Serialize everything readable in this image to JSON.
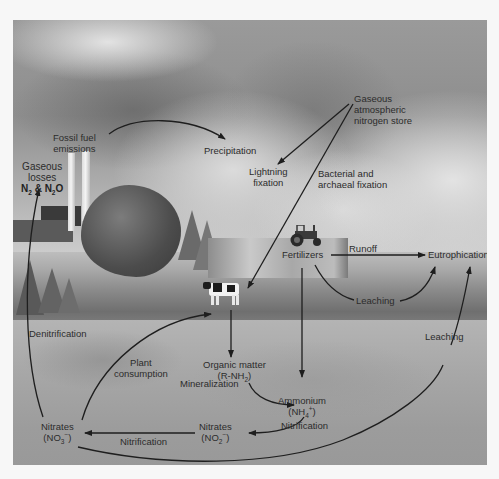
{
  "diagram": {
    "colors": {
      "page_background": "#f7f7f7",
      "text": "#2c2c2c",
      "arrow": "#1e1e1e",
      "sky": "#9a9a9a",
      "ground": "#a6a6a6"
    },
    "nodes": {
      "fossil_fuel": {
        "line1": "Fossil fuel",
        "line2": "emissions"
      },
      "precipitation": {
        "text": "Precipitation"
      },
      "gaseous_store": {
        "line1": "Gaseous",
        "line2": "atmospheric",
        "line3": "nitrogen store"
      },
      "lightning": {
        "line1": "Lightning",
        "line2": "fixation"
      },
      "bacterial": {
        "line1": "Bacterial and",
        "line2": "archaeal fixation"
      },
      "gaseous_losses": {
        "line1": "Gaseous",
        "line2": "losses",
        "formula_n": "N",
        "sub1": "2",
        "amp": " & N",
        "sub2": "2",
        "o": "O"
      },
      "fertilizers": {
        "text": "Fertilizers"
      },
      "runoff": {
        "text": "Runoff"
      },
      "eutrophication": {
        "text": "Eutrophication"
      },
      "leaching_upper": {
        "text": "Leaching"
      },
      "leaching_right": {
        "text": "Leaching"
      },
      "denitrification": {
        "text": "Denitrification"
      },
      "plant_consumption": {
        "line1": "Plant",
        "line2": "consumption"
      },
      "organic_matter": {
        "line1": "Organic matter",
        "formula_pre": "(R-NH",
        "sub": "2",
        "formula_post": ")"
      },
      "mineralization": {
        "text": "Mineralization"
      },
      "ammonium": {
        "line1": "Ammonium",
        "formula_pre": "(NH",
        "sub": "4",
        "sup": "+",
        "formula_post": ")"
      },
      "nitrification_right": {
        "text": "Nitrification"
      },
      "nitrites": {
        "line1": "Nitrates",
        "formula_pre": "(NO",
        "sub": "2",
        "sup": "−",
        "formula_post": ")"
      },
      "nitrification_left": {
        "text": "Nitrification"
      },
      "nitrates": {
        "line1": "Nitrates",
        "formula_pre": "(NO",
        "sub": "3",
        "sup": "−",
        "formula_post": ")"
      }
    },
    "edges": [
      {
        "from": "Fossil fuel emissions",
        "to": "Precipitation"
      },
      {
        "from": "Gaseous atmospheric nitrogen store",
        "to": "Lightning fixation"
      },
      {
        "from": "Gaseous atmospheric nitrogen store",
        "to": "Field (bacterial and archaeal fixation)"
      },
      {
        "from": "Fertilizers",
        "to": "Eutrophication",
        "label": "Runoff"
      },
      {
        "from": "Fertilizers",
        "to": "Eutrophication",
        "label": "Leaching"
      },
      {
        "from": "Fertilizers",
        "to": "Ammonium"
      },
      {
        "from": "Cow / plants",
        "to": "Organic matter"
      },
      {
        "from": "Organic matter",
        "to": "Ammonium",
        "label": "Mineralization"
      },
      {
        "from": "Ammonium",
        "to": "Nitrates (NO2-)",
        "label": "Nitrification"
      },
      {
        "from": "Nitrates (NO2-)",
        "to": "Nitrates (NO3-)",
        "label": "Nitrification"
      },
      {
        "from": "Nitrates (NO3-)",
        "to": "Plants",
        "label": "Plant consumption"
      },
      {
        "from": "Nitrates (NO3-)",
        "to": "Gaseous losses",
        "label": "Denitrification"
      },
      {
        "from": "Nitrates (NO3-)",
        "to": "Eutrophication",
        "label": "Leaching"
      }
    ]
  }
}
